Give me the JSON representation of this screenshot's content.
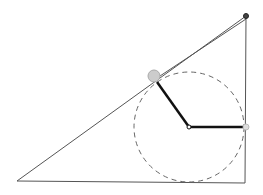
{
  "diagram": {
    "type": "geometry-construction",
    "colors": {
      "background": "#ffffff",
      "triangle_stroke": "#555555",
      "circle_stroke": "#666666",
      "radius_stroke": "#111111",
      "tangent_dot_fill": "#cccccc",
      "tangent_dot_stroke": "#aaaaaa",
      "vertex_dot_fill": "#444444"
    },
    "triangle": {
      "vertices": [
        [
          17,
          181
        ],
        [
          245,
          183
        ],
        [
          246,
          16
        ]
      ]
    },
    "incircle": {
      "cx": 189,
      "cy": 127,
      "r": 55,
      "dashed": true
    },
    "radii": [
      {
        "from": [
          189,
          127
        ],
        "to": [
          157,
          82
        ]
      },
      {
        "from": [
          189,
          127
        ],
        "to": [
          246,
          127
        ]
      }
    ],
    "tangent_points": [
      {
        "name": "hypotenuse-tangent",
        "x": 154,
        "y": 76,
        "r": 6
      },
      {
        "name": "side-tangent",
        "x": 246,
        "y": 127,
        "r": 3
      }
    ],
    "center_point": {
      "x": 189,
      "y": 127,
      "r": 2
    },
    "top_vertex": {
      "x": 246,
      "y": 16,
      "r": 2.5
    },
    "hypotenuse_offset_line": {
      "from": [
        161,
        74
      ],
      "to": [
        246,
        18
      ]
    }
  }
}
